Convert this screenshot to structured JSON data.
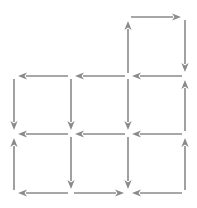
{
  "diagram": {
    "type": "directed-grid-graph",
    "style": {
      "stroke_color": "#8a8a8a",
      "background": "#ffffff",
      "stroke_width": 1.6
    },
    "nodes": {
      "xs": [
        14,
        71,
        128,
        185
      ],
      "ys": [
        17,
        76,
        134,
        193
      ]
    },
    "edges": [
      {
        "from": [
          128,
          76
        ],
        "to": [
          128,
          17
        ]
      },
      {
        "from": [
          128,
          17
        ],
        "to": [
          185,
          17
        ]
      },
      {
        "from": [
          185,
          17
        ],
        "to": [
          185,
          76
        ]
      },
      {
        "from": [
          185,
          76
        ],
        "to": [
          128,
          76
        ]
      },
      {
        "from": [
          128,
          76
        ],
        "to": [
          71,
          76
        ]
      },
      {
        "from": [
          71,
          76
        ],
        "to": [
          14,
          76
        ]
      },
      {
        "from": [
          14,
          76
        ],
        "to": [
          14,
          134
        ]
      },
      {
        "from": [
          71,
          76
        ],
        "to": [
          71,
          134
        ]
      },
      {
        "from": [
          128,
          76
        ],
        "to": [
          128,
          134
        ]
      },
      {
        "from": [
          185,
          134
        ],
        "to": [
          185,
          76
        ]
      },
      {
        "from": [
          185,
          134
        ],
        "to": [
          128,
          134
        ]
      },
      {
        "from": [
          128,
          134
        ],
        "to": [
          71,
          134
        ]
      },
      {
        "from": [
          71,
          134
        ],
        "to": [
          14,
          134
        ]
      },
      {
        "from": [
          14,
          193
        ],
        "to": [
          14,
          134
        ]
      },
      {
        "from": [
          71,
          134
        ],
        "to": [
          71,
          193
        ]
      },
      {
        "from": [
          128,
          134
        ],
        "to": [
          128,
          193
        ]
      },
      {
        "from": [
          71,
          193
        ],
        "to": [
          14,
          193
        ]
      },
      {
        "from": [
          71,
          193
        ],
        "to": [
          128,
          193
        ]
      },
      {
        "from": [
          185,
          193
        ],
        "to": [
          128,
          193
        ]
      },
      {
        "from": [
          185,
          193
        ],
        "to": [
          185,
          134
        ]
      }
    ]
  }
}
